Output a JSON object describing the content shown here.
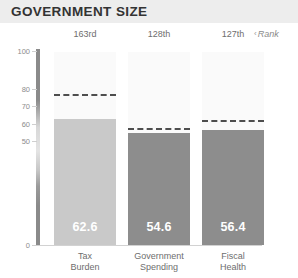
{
  "header": {
    "title": "GOVERNMENT SIZE",
    "background_color": "#ededed",
    "text_color": "#333333"
  },
  "rank_legend": {
    "label": "Rank",
    "marker": "‹"
  },
  "chart_data": {
    "type": "bar",
    "title": "GOVERNMENT SIZE",
    "xlabel": "",
    "ylabel": "",
    "ylim": [
      0,
      100
    ],
    "grid": false,
    "legend_position": "right",
    "categories": [
      "Tax Burden",
      "Government Spending",
      "Fiscal Health"
    ],
    "category_lines": [
      [
        "Tax",
        "Burden"
      ],
      [
        "Government",
        "Spending"
      ],
      [
        "Fiscal",
        "Health"
      ]
    ],
    "values": [
      62.6,
      54.6,
      56.4
    ],
    "value_labels": [
      "62.6",
      "54.6",
      "56.4"
    ],
    "ranks": [
      "163rd",
      "128th",
      "127th"
    ],
    "reference_lines": [
      77.0,
      57.5,
      62.0
    ],
    "reference_line_style": "dashed",
    "reference_line_color": "#4e4e4e",
    "bar_colors": [
      "#c9c9c9",
      "#8d8d8d",
      "#8d8d8d"
    ],
    "ytick_labels": [
      "100",
      "80",
      "70",
      "60",
      "50",
      "0"
    ],
    "ytick_values": [
      100,
      80,
      70,
      60,
      50,
      0
    ],
    "axis_note": "non-linear broken y-axis"
  }
}
